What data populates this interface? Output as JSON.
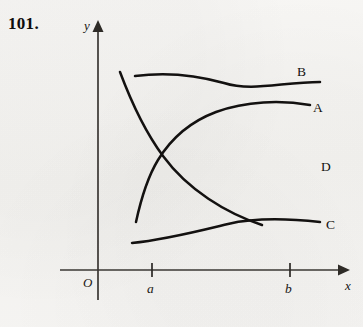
{
  "exercise": {
    "number": "101."
  },
  "figure": {
    "axes": {
      "y_label": "y",
      "x_label": "x",
      "origin_label": "O",
      "x_axis_y": 270,
      "y_axis_x": 98,
      "x_axis_start": 60,
      "x_axis_end": 345,
      "y_axis_top": 22,
      "y_axis_bottom": 300
    },
    "ticks": [
      {
        "label": "a",
        "x": 152
      },
      {
        "label": "b",
        "x": 290
      }
    ],
    "curves": [
      {
        "id": "A",
        "label": "A",
        "label_x": 313,
        "label_y": 112,
        "shape": "increasing-concave-down",
        "start": [
          136,
          222
        ],
        "end": [
          310,
          105
        ],
        "path": "M 136 222 C 141 199 147 178 158 160 C 172 137 192 121 216 112 C 246 101 281 100 310 105"
      },
      {
        "id": "B",
        "label": "B",
        "label_x": 297,
        "label_y": 76,
        "shape": "slowly-decreasing-concave-down",
        "start": [
          135,
          76
        ],
        "end": [
          320,
          82
        ],
        "path": "M 135 76 C 165 72 196 75 224 83 C 252 92 282 82 320 82"
      },
      {
        "id": "C",
        "label": "C",
        "label_x": 326,
        "label_y": 229,
        "shape": "slowly-increasing-concave-down",
        "start": [
          132,
          243
        ],
        "end": [
          320,
          222
        ],
        "path": "M 132 243 C 164 240 199 231 228 224 C 258 217 292 219 320 222"
      },
      {
        "id": "D",
        "label": "D",
        "label_x": 321,
        "label_y": 171,
        "shape": "decreasing-concave-up",
        "start": [
          120,
          72
        ],
        "end": [
          318,
          185
        ],
        "path": "M 120 72 C 132 104 146 133 163 156 C 188 190 226 213 262 225"
      }
    ],
    "intersections": [
      {
        "curves": "A-D",
        "x": 158,
        "y": 152
      },
      {
        "curves": "B-D",
        "x": 252,
        "y": 95
      },
      {
        "curves": "A-D",
        "x": 300,
        "y": 133
      },
      {
        "curves": "A-C",
        "x": 242,
        "y": 213
      }
    ]
  },
  "colors": {
    "ink": "#131110",
    "axis": "#3a3733",
    "paper": "#f5f4f2"
  }
}
